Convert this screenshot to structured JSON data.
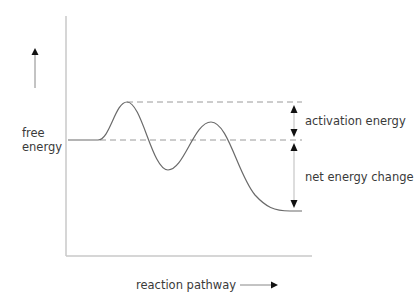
{
  "diagram": {
    "type": "energy_profile",
    "title": "",
    "y_axis_label_line1": "free",
    "y_axis_label_line2": "energy",
    "x_axis_label": "reaction pathway",
    "annotations": {
      "activation_energy": "activation energy",
      "net_energy_change": "net energy change"
    },
    "levels": {
      "reactants": "initial free energy level",
      "transition_state": "highest peak",
      "products": "final free energy level"
    },
    "colors": {
      "curve": "#6a6a6a",
      "axis": "#c8c8c8",
      "dashed": "#9a9a9a",
      "arrow": "#111111",
      "text": "#3a3a3a"
    }
  }
}
